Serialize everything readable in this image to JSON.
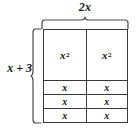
{
  "diagram": {
    "type": "algebra-tiles-area-model",
    "top_dimension": {
      "coefficient": "2",
      "variable": "x",
      "full_label": "2x"
    },
    "left_dimension": {
      "term1": "x",
      "operator": "+",
      "term2": "3",
      "full_label": "x + 3"
    },
    "grid": {
      "columns": 2,
      "rows": 4,
      "row_groups": [
        {
          "kind": "x-squared",
          "count": 1,
          "cells": [
            {
              "base": "x",
              "exponent": "2"
            },
            {
              "base": "x",
              "exponent": "2"
            }
          ]
        },
        {
          "kind": "x",
          "count": 3,
          "cells": [
            {
              "base": "x",
              "exponent": ""
            },
            {
              "base": "x",
              "exponent": ""
            }
          ]
        }
      ]
    },
    "colors": {
      "line": "#3a3a3a",
      "text": "#111111",
      "background": "#ffffff"
    }
  },
  "labels": {
    "top": "2x",
    "left": "x + 3",
    "cell_x_squared_base": "x",
    "cell_x_squared_exp": "2",
    "cell_x": "x"
  }
}
